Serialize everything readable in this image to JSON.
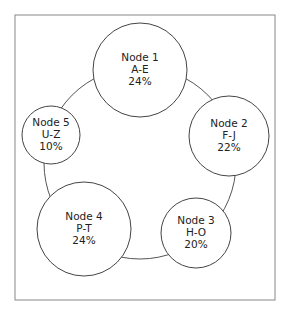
{
  "diagram": {
    "type": "consistent-hash-ring",
    "frame": {
      "x": 15,
      "y": 15,
      "width": 260,
      "height": 285,
      "stroke": "#888888"
    },
    "ring": {
      "cx": 140,
      "cy": 163,
      "r": 96,
      "stroke": "#555555"
    },
    "nodes": [
      {
        "name": "Node 1",
        "range": "A-E",
        "share": "24%",
        "cx": 140,
        "cy": 70,
        "r": 47
      },
      {
        "name": "Node 2",
        "range": "F-J",
        "share": "22%",
        "cx": 229,
        "cy": 136,
        "r": 40
      },
      {
        "name": "Node 3",
        "range": "H-O",
        "share": "20%",
        "cx": 196,
        "cy": 233,
        "r": 35
      },
      {
        "name": "Node 4",
        "range": "P-T",
        "share": "24%",
        "cx": 84,
        "cy": 229,
        "r": 47
      },
      {
        "name": "Node 5",
        "range": "U-Z",
        "share": "10%",
        "cx": 51,
        "cy": 135,
        "r": 29
      }
    ]
  }
}
